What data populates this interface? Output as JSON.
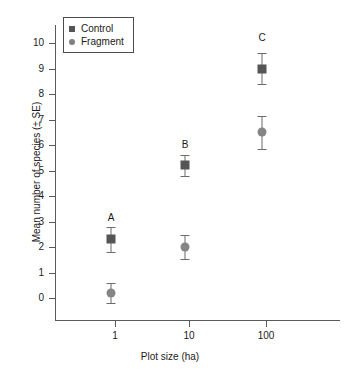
{
  "chart_data": {
    "type": "scatter",
    "title": "",
    "xlabel": "Plot size (ha)",
    "ylabel": "Mean number of species (± SE)",
    "categories": [
      "1",
      "10",
      "100"
    ],
    "ylim": [
      0,
      10
    ],
    "y_ticks": [
      "0",
      "1",
      "2",
      "3",
      "4",
      "5",
      "6",
      "7",
      "8",
      "9",
      "10"
    ],
    "grid": false,
    "legend_position": "top-left",
    "series": [
      {
        "name": "Control",
        "marker": "square",
        "color": "#555555",
        "values": [
          2.3,
          5.2,
          9.0
        ],
        "errors": [
          0.5,
          0.4,
          0.62
        ]
      },
      {
        "name": "Fragment",
        "marker": "circle",
        "color": "#858585",
        "values": [
          0.2,
          2.0,
          6.5
        ],
        "errors": [
          0.4,
          0.47,
          0.65
        ]
      }
    ],
    "annotations": [
      {
        "text": "A",
        "category": "1",
        "y": 3.15
      },
      {
        "text": "B",
        "category": "10",
        "y": 6.0
      },
      {
        "text": "C",
        "category": "100",
        "y": 10.2
      }
    ]
  },
  "legend": {
    "items": [
      {
        "label": "Control"
      },
      {
        "label": "Fragment"
      }
    ]
  },
  "axes": {
    "x_title": "Plot size (ha)",
    "y_title": "Mean number of species (± SE)"
  }
}
